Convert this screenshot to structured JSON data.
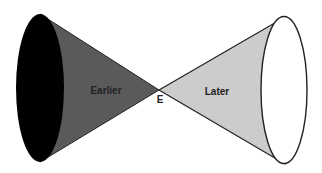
{
  "diagram": {
    "nodes": {
      "earlier": {
        "label": "Earlier",
        "fill": "#5a5a5a",
        "cap_fill": "#000000"
      },
      "later": {
        "label": "Later",
        "fill": "#cccccc",
        "cap_fill": "#ffffff"
      },
      "event": {
        "label": "E"
      }
    },
    "colors": {
      "stroke": "#222222",
      "background": "#ffffff"
    }
  }
}
